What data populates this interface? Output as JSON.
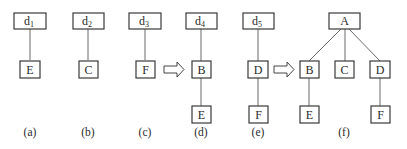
{
  "figure": {
    "panels": [
      {
        "id": "a",
        "caption": "(a)",
        "root": {
          "label": "d",
          "subscript": "1"
        },
        "children": [
          "E"
        ]
      },
      {
        "id": "b",
        "caption": "(b)",
        "root": {
          "label": "d",
          "subscript": "2"
        },
        "children": [
          "C"
        ]
      },
      {
        "id": "c",
        "caption": "(c)",
        "root": {
          "label": "d",
          "subscript": "3"
        },
        "children": [
          "F"
        ]
      },
      {
        "id": "d",
        "caption": "(d)",
        "root": {
          "label": "d",
          "subscript": "4"
        },
        "chain": [
          "B",
          "E"
        ]
      },
      {
        "id": "e",
        "caption": "(e)",
        "root": {
          "label": "d",
          "subscript": "5"
        },
        "chain": [
          "D",
          "F"
        ]
      },
      {
        "id": "f",
        "caption": "(f)",
        "root": {
          "label": "A"
        },
        "children": [
          "B",
          "C",
          "D"
        ],
        "grandchildren": {
          "B": "E",
          "D": "F"
        }
      }
    ],
    "arrows": [
      {
        "from": "c",
        "to": "d"
      },
      {
        "from": "e",
        "to": "f"
      }
    ]
  }
}
